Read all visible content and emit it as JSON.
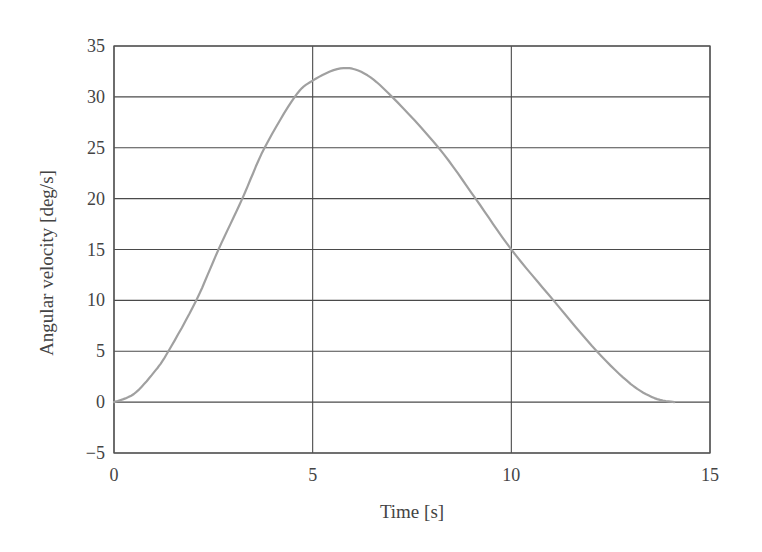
{
  "chart_data": {
    "type": "line",
    "title": "",
    "xlabel": "Time [s]",
    "ylabel": "Angular velocity [deg/s]",
    "xlim": [
      0,
      15
    ],
    "ylim": [
      -5,
      35
    ],
    "xticks": [
      0,
      5,
      10,
      15
    ],
    "yticks": [
      -5,
      0,
      5,
      10,
      15,
      20,
      25,
      30,
      35
    ],
    "xtick_labels": [
      "0",
      "5",
      "10",
      "15"
    ],
    "ytick_labels": [
      "−5",
      "0",
      "5",
      "10",
      "15",
      "20",
      "25",
      "30",
      "35"
    ],
    "grid": true,
    "legend": null,
    "series": [
      {
        "name": "Angular velocity",
        "color": "#a0a0a0",
        "x": [
          0,
          0.5,
          1.0,
          1.37,
          2.07,
          2.63,
          3.23,
          3.79,
          4.55,
          5.0,
          5.7,
          6.3,
          7.0,
          8.17,
          9.1,
          10.0,
          11.06,
          12.15,
          13.0,
          13.6,
          14.1
        ],
        "y": [
          0,
          0.8,
          2.9,
          5,
          10,
          15,
          20,
          25,
          30,
          31.6,
          32.8,
          32.3,
          30,
          25,
          20,
          15,
          10,
          5,
          1.8,
          0.4,
          0
        ]
      }
    ]
  },
  "colors": {
    "grid": "#4a4a4a",
    "frame": "#555555",
    "curve": "#a0a0a0",
    "text": "#444444"
  }
}
